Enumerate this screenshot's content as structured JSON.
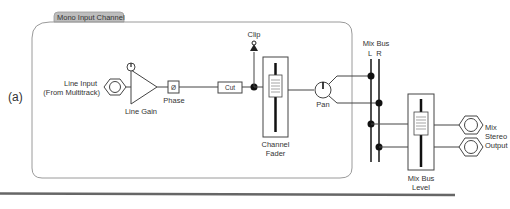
{
  "figure_label": "(a)",
  "channel": {
    "title": "Mono Input Channel"
  },
  "components": {
    "line_input": {
      "line1": "Line Input",
      "line2": "(From Multitrack)",
      "icon": "xlr-jack-icon"
    },
    "line_gain": {
      "label": "Line Gain",
      "icon": "amplifier-triangle-icon"
    },
    "phase": {
      "label": "Phase",
      "symbol": "Ø"
    },
    "cut": {
      "label": "Cut"
    },
    "clip": {
      "label": "Clip",
      "icon": "clip-led-icon"
    },
    "channel_fader": {
      "line1": "Channel",
      "line2": "Fader",
      "icon": "fader-icon"
    },
    "pan": {
      "label": "Pan",
      "icon": "knob-icon"
    },
    "mix_bus": {
      "title": "Mix Bus",
      "left": "L",
      "right": "R"
    },
    "mix_bus_level": {
      "line1": "Mix Bus",
      "line2": "Level",
      "icon": "fader-icon"
    },
    "mix_stereo_output": {
      "line1": "Mix",
      "line2": "Stereo",
      "line3": "Output",
      "icon": "xlr-jack-icon"
    }
  },
  "colors": {
    "line": "#444444",
    "tab_bg": "#bdbdbd",
    "panel_border": "#9a9a9a",
    "separator": "#666666"
  }
}
